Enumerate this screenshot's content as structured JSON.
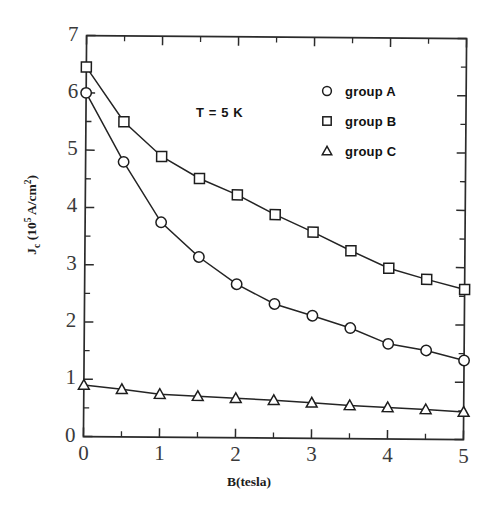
{
  "chart_data": {
    "type": "line",
    "title": "",
    "xlabel": "B(tesla)",
    "ylabel": "J_c (10^5 A/cm^2)",
    "ylabel_parts": {
      "base": "J",
      "sub": "c",
      "mid": " (10",
      "sup1": "5",
      "tail": " A/cm",
      "sup2": "2",
      "close": ")"
    },
    "annotation": "T = 5 K",
    "xlim": [
      0,
      5
    ],
    "ylim": [
      0,
      7
    ],
    "xticks": [
      0,
      1,
      2,
      3,
      4,
      5
    ],
    "yticks": [
      0,
      1,
      2,
      3,
      4,
      5,
      6,
      7
    ],
    "xtick_labels": [
      "0",
      "1",
      "2",
      "3",
      "4",
      "5"
    ],
    "ytick_labels": [
      "0",
      "1",
      "2",
      "3",
      "4",
      "5",
      "6",
      "7"
    ],
    "minor_tick_step": 0.5,
    "grid": false,
    "legend_position": "top-right",
    "x": [
      0,
      0.5,
      1,
      1.5,
      2,
      2.5,
      3,
      3.5,
      4,
      4.5,
      5
    ],
    "series": [
      {
        "name": "group A",
        "marker": "circle",
        "values": [
          6.0,
          4.8,
          3.75,
          3.15,
          2.68,
          2.34,
          2.14,
          1.93,
          1.66,
          1.55,
          1.38
        ]
      },
      {
        "name": "group B",
        "marker": "square",
        "values": [
          6.45,
          5.5,
          4.9,
          4.52,
          4.24,
          3.9,
          3.6,
          3.28,
          2.98,
          2.79,
          2.62
        ]
      },
      {
        "name": "group C",
        "marker": "triangle",
        "values": [
          0.9,
          0.83,
          0.75,
          0.72,
          0.69,
          0.66,
          0.62,
          0.58,
          0.55,
          0.52,
          0.48
        ]
      }
    ]
  },
  "legend": {
    "items": [
      {
        "label": "group A",
        "marker": "circle"
      },
      {
        "label": "group B",
        "marker": "square"
      },
      {
        "label": "group C",
        "marker": "triangle"
      }
    ]
  },
  "colors": {
    "background": "#ffffff",
    "axis": "#2b2b2b",
    "line": "#242424",
    "marker_fill": "#ffffff",
    "marker_stroke": "#1d1d1d",
    "text": "#1a1a1a"
  }
}
